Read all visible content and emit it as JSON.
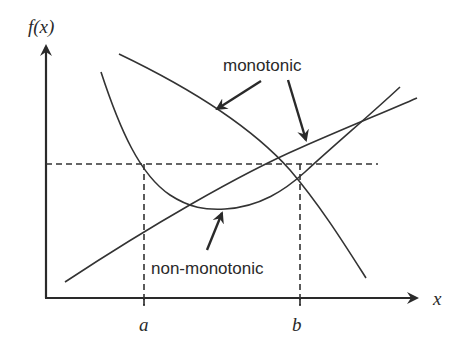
{
  "diagram": {
    "axes": {
      "y_label": "f(x)",
      "x_label": "x",
      "tick_a": "a",
      "tick_b": "b"
    },
    "annotations": {
      "monotonic": "monotonic",
      "non_monotonic": "non-monotonic"
    },
    "curves": [
      {
        "name": "monotonic-decreasing",
        "description": "decreasing curve crossing the threshold once"
      },
      {
        "name": "monotonic-increasing",
        "description": "increasing line crossing the threshold once"
      },
      {
        "name": "non-monotonic",
        "description": "U-shaped curve crossing the threshold at a and b"
      }
    ],
    "threshold": "horizontal dashed line",
    "colors": {
      "stroke": "#333333",
      "background": "#ffffff"
    }
  }
}
